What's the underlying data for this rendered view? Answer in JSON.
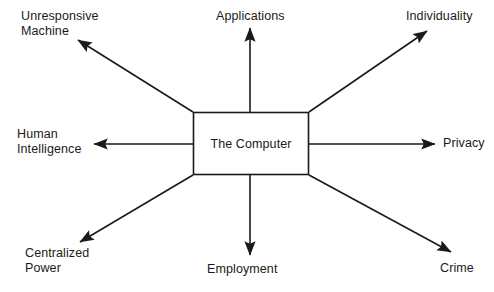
{
  "diagram": {
    "type": "radial-spoke-diagram",
    "title": "",
    "center": {
      "id": "the-computer",
      "label": "The Computer",
      "shape": "rectangle",
      "box": {
        "x": 193,
        "y": 112,
        "width": 116,
        "height": 63
      }
    },
    "style": {
      "line_color": "#1a1a1a",
      "text_color": "#1a1a1a",
      "background": "#ffffff",
      "line_width": 1.6,
      "arrowhead": "solid-triangle"
    },
    "nodes": [
      {
        "id": "unresponsive-machine",
        "label": "Unresponsive\nMachine",
        "lines": [
          "Unresponsive",
          "Machine"
        ],
        "direction": "up-left",
        "edge_from": [
          193,
          112
        ],
        "arrow_tip": [
          76,
          39
        ]
      },
      {
        "id": "applications",
        "label": "Applications",
        "lines": [
          "Applications"
        ],
        "direction": "up",
        "edge_from": [
          250,
          112
        ],
        "arrow_tip": [
          250,
          26
        ]
      },
      {
        "id": "individuality",
        "label": "Individuality",
        "lines": [
          "Individuality"
        ],
        "direction": "up-right",
        "edge_from": [
          309,
          112
        ],
        "arrow_tip": [
          429,
          30
        ]
      },
      {
        "id": "human-intelligence",
        "label": "Human\nIntelligence",
        "lines": [
          "Human",
          "Intelligence"
        ],
        "direction": "left",
        "edge_from": [
          193,
          144
        ],
        "arrow_tip": [
          92,
          144
        ]
      },
      {
        "id": "privacy",
        "label": "Privacy",
        "lines": [
          "Privacy"
        ],
        "direction": "right",
        "edge_from": [
          309,
          144
        ],
        "arrow_tip": [
          437,
          144
        ]
      },
      {
        "id": "centralized-power",
        "label": "Centralized\nPower",
        "lines": [
          "Centralized",
          "Power"
        ],
        "direction": "down-left",
        "edge_from": [
          193,
          175
        ],
        "arrow_tip": [
          78,
          243
        ]
      },
      {
        "id": "employment",
        "label": "Employment",
        "lines": [
          "Employment"
        ],
        "direction": "down",
        "edge_from": [
          250,
          175
        ],
        "arrow_tip": [
          250,
          257
        ]
      },
      {
        "id": "crime",
        "label": "Crime",
        "lines": [
          "Crime"
        ],
        "direction": "down-right",
        "edge_from": [
          309,
          175
        ],
        "arrow_tip": [
          453,
          253
        ]
      }
    ]
  }
}
